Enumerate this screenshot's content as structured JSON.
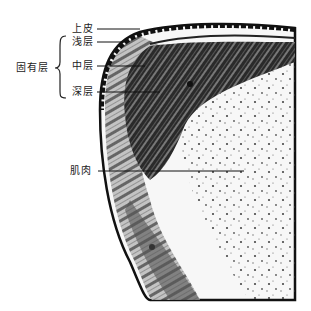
{
  "figure": {
    "type": "histology-illustration",
    "labels": {
      "epithelium": "上皮",
      "superficial_layer": "浅层",
      "middle_layer": "中层",
      "deep_layer": "深层",
      "lamina_propria": "固有层",
      "muscle": "肌肉"
    },
    "colors": {
      "ink": "#111111",
      "background": "#ffffff",
      "tissue_light": "#f4f4f4"
    }
  }
}
